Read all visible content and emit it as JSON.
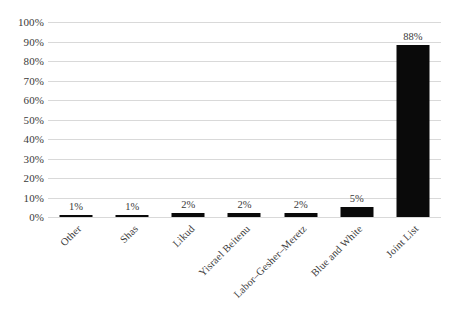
{
  "chart_data": {
    "type": "bar",
    "title": "",
    "subtitle": "",
    "xlabel": "",
    "ylabel": "",
    "categories": [
      "Other",
      "Shas",
      "Likud",
      "Yisrael Beitenu",
      "Labor–Gesher–Meretz",
      "Blue and White",
      "Joint List"
    ],
    "values": [
      1,
      1,
      2,
      2,
      2,
      5,
      88
    ],
    "data_labels": [
      "1%",
      "1%",
      "2%",
      "2%",
      "2%",
      "5%",
      "88%"
    ],
    "ylim": [
      0,
      100
    ],
    "y_tick_values": [
      0,
      10,
      20,
      30,
      40,
      50,
      60,
      70,
      80,
      90,
      100
    ],
    "y_tick_labels": [
      "100%",
      "90%",
      "80%",
      "70%",
      "60%",
      "50%",
      "40%",
      "30%",
      "20%",
      "10%",
      "0%"
    ],
    "grid": true,
    "grid_axis": "y",
    "legend": false,
    "legend_position": "none",
    "bar_color": "#0a0a0a",
    "grid_color": "#d9d9d9",
    "background_color": "#ffffff",
    "text_color": "#3a3a3a",
    "x_label_rotation": -45
  }
}
